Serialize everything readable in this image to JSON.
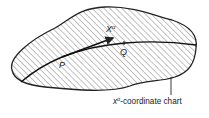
{
  "figure": {
    "region_label": "coordinate chart",
    "region_label_prefix": "x",
    "region_label_superscript": "α",
    "vector_label": "X",
    "vector_label_superscript": "α",
    "point_p": "P",
    "point_q": "Q",
    "colors": {
      "stroke": "#222222",
      "hatch": "#555555",
      "background": "#ffffff"
    }
  }
}
